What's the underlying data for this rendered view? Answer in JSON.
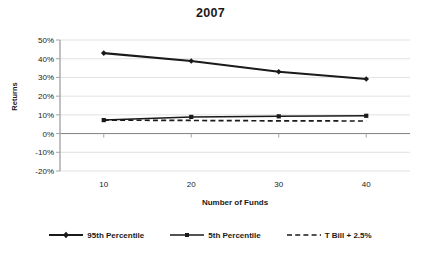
{
  "chart_data": {
    "type": "line",
    "title": "2007",
    "xlabel": "Number of Funds",
    "ylabel": "Returns",
    "x": [
      10,
      20,
      30,
      40
    ],
    "xtick_labels": [
      "10",
      "20",
      "30",
      "40"
    ],
    "xlim": [
      5,
      45
    ],
    "ylim": [
      -0.2,
      0.5
    ],
    "ytick_labels": [
      "50%",
      "40%",
      "30%",
      "20%",
      "10%",
      "0%",
      "-10%",
      "-20%"
    ],
    "ytick_values": [
      0.5,
      0.4,
      0.3,
      0.2,
      0.1,
      0.0,
      -0.1,
      -0.2
    ],
    "grid": true,
    "legend_position": "bottom",
    "series": [
      {
        "name": "95th Percentile",
        "style": "solid-thick",
        "marker": "diamond",
        "color": "#1a1a1a",
        "values": [
          0.43,
          0.388,
          0.33,
          0.292
        ],
        "value_labels": [
          "43%",
          "38.8%",
          "33%",
          "29.2%"
        ]
      },
      {
        "name": "5th Percentile",
        "style": "solid-thin",
        "marker": "square",
        "color": "#1a1a1a",
        "values": [
          0.072,
          0.089,
          0.092,
          0.095
        ],
        "value_labels": [
          "7.2%",
          "8.9%",
          "9.2%",
          "9.5%"
        ]
      },
      {
        "name": "T Bill + 2.5%",
        "style": "dashed",
        "marker": "none",
        "color": "#1a1a1a",
        "values": [
          0.072,
          0.07,
          0.068,
          0.067
        ],
        "value_labels": [
          "7.2%",
          "7.0%",
          "6.8%",
          "6.7%"
        ]
      }
    ]
  },
  "colors": {
    "ink": "#1a1a1a",
    "grid": "#d9d9d9",
    "axis": "#a6a6a6",
    "zero_line": "#808080",
    "background": "#ffffff"
  }
}
